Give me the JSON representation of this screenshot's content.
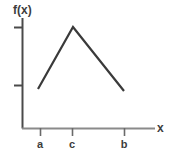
{
  "figure": {
    "width": 170,
    "height": 154,
    "background_color": "#ffffff",
    "ink_color": "#4a4a4a",
    "text_color": "#3d3d3d"
  },
  "axes": {
    "y_axis_label": "f(x)",
    "x_axis_label": "x",
    "origin_px": {
      "x": 22,
      "y": 128
    },
    "y_axis_top_px": 18,
    "x_axis_right_px": 155,
    "y_ticks_px": [
      27,
      85
    ],
    "x_ticks": [
      {
        "label": "a",
        "x_px": 40
      },
      {
        "label": "c",
        "x_px": 72
      },
      {
        "label": "b",
        "x_px": 124
      }
    ]
  },
  "chart_data": {
    "type": "line",
    "title": "",
    "subtitle": "",
    "xlabel": "x",
    "ylabel": "f(x)",
    "grid": false,
    "legend": false,
    "legend_position": "none",
    "annotations": [],
    "x_tick_labels": [
      "a",
      "c",
      "b"
    ],
    "y_tick_labels": [
      "",
      ""
    ],
    "xlim": [
      0,
      1
    ],
    "ylim": [
      0,
      1
    ],
    "series": [
      {
        "name": "f(x)",
        "color": "#3a3a3a",
        "x": [
          "a",
          "c",
          "b"
        ],
        "x_px": [
          38,
          73,
          124
        ],
        "y_px": [
          89,
          27,
          91
        ],
        "values": [
          0.38,
          1.0,
          0.36
        ],
        "description": "Piecewise linear: rises from a up to a maximum at c, then falls to b"
      }
    ]
  }
}
